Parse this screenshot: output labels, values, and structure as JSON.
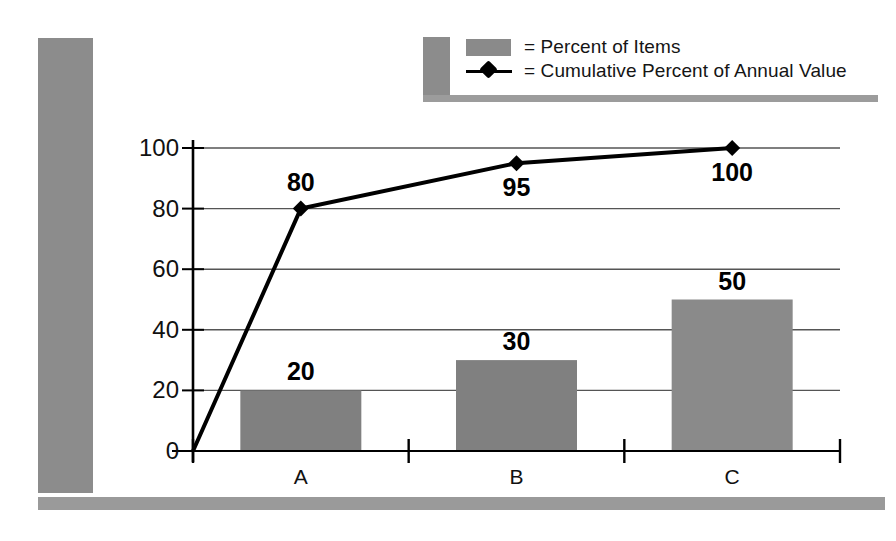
{
  "legend": {
    "items": [
      {
        "key": "bar-swatch",
        "label": "= Percent of Items"
      },
      {
        "key": "line-swatch",
        "label": "= Cumulative Percent of Annual Value"
      }
    ]
  },
  "colors": {
    "bar_fill": "#808080",
    "bar_fill_light": "#8a8a8a",
    "line": "#000000",
    "gridline": "#555555",
    "axis": "#000000",
    "frame_gray": "#8c8c8c"
  },
  "chart_data": {
    "type": "bar",
    "title": "",
    "xlabel": "",
    "ylabel": "",
    "categories": [
      "A",
      "B",
      "C"
    ],
    "ylim": [
      0,
      100
    ],
    "yticks": [
      0,
      20,
      40,
      60,
      80,
      100
    ],
    "grid": true,
    "legend_position": "top",
    "series": [
      {
        "name": "Percent of Items",
        "type": "bar",
        "values": [
          20,
          30,
          50
        ],
        "labels": [
          "20",
          "30",
          "50"
        ],
        "label_position": "above"
      },
      {
        "name": "Cumulative Percent of Annual Value",
        "type": "line",
        "values": [
          80,
          95,
          100
        ],
        "labels": [
          "80",
          "95",
          "100"
        ],
        "label_position": [
          "above",
          "below",
          "below"
        ],
        "marker": "diamond",
        "origin_point": 0
      }
    ]
  },
  "axis": {
    "ytick_labels": [
      "100",
      "80",
      "60",
      "40",
      "20",
      "0"
    ],
    "xtick_labels": [
      "A",
      "B",
      "C"
    ]
  }
}
